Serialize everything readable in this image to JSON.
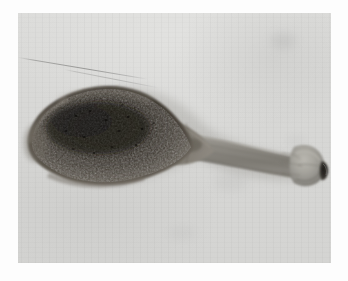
{
  "image": {
    "kind": "specimen-photograph",
    "subject": "parasitic-worm-specimen",
    "orientation": "horizontal",
    "alt_text": "Photograph of an elongate parasitic worm specimen with a large dark bulbous posterior body tapering through a narrow pale neck into a slender stalk that ends in a rounded knobbed head bearing a dark oral opening, mounted on a pale grey background inside a white border.",
    "width": 348,
    "height": 281
  },
  "mount": {
    "name": "white-photo-border",
    "color": "#fdfdfd",
    "inset_left": 18,
    "inset_top": 13,
    "plate_width": 313,
    "plate_height": 250
  },
  "plate": {
    "background_color": "#d8d8d6",
    "background_highlight": "#e3e3e1",
    "background_shadow": "#d2d2d0",
    "grain": "vertical-streaks"
  },
  "specimen": {
    "body": {
      "name": "bulbous-posterior-body",
      "fill_dark": "#2a2824",
      "fill_mid": "#4a463f",
      "fill_edge": "#6d6962",
      "texture": "granular-speckled",
      "bbox": [
        18,
        72,
        148,
        98
      ]
    },
    "neck": {
      "name": "constricted-neck",
      "fill": "#7b776f",
      "bbox": [
        140,
        112,
        60,
        46
      ]
    },
    "tail": {
      "name": "slender-stalk",
      "fill": "#8a8a85",
      "fill_highlight": "#a5a5a0",
      "bbox": [
        196,
        126,
        90,
        42
      ]
    },
    "head": {
      "name": "knobbed-head",
      "fill": "#9a9a94",
      "fill_highlight": "#b4b4ae",
      "bbox": [
        278,
        134,
        40,
        38
      ]
    },
    "mouth": {
      "name": "oral-opening",
      "fill": "#3a3834",
      "shape": "dark-crescent",
      "bbox": [
        302,
        148,
        9,
        17
      ]
    }
  },
  "artifacts": {
    "fibre": {
      "name": "stray-fibre-scratch",
      "description": "thin diagonal filament across the upper-left background",
      "color": "#96968f"
    },
    "blots": [
      {
        "name": "background-blot-upper-right",
        "x": 252,
        "y": 20
      },
      {
        "name": "background-blot-center",
        "x": 196,
        "y": 160
      },
      {
        "name": "background-blot-left",
        "x": 36,
        "y": 120
      },
      {
        "name": "background-blot-lower",
        "x": 150,
        "y": 214
      },
      {
        "name": "background-blot-right",
        "x": 268,
        "y": 122
      }
    ]
  },
  "caption": {
    "text": ""
  }
}
